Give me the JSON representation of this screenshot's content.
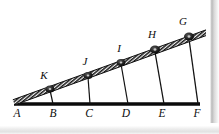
{
  "figure": {
    "type": "geometry-diagram",
    "background_color": "#ffffff",
    "ink_color": "#111111",
    "baseline": {
      "label": "ground-line",
      "x1": 14,
      "y1": 104,
      "x2": 200,
      "y2": 104,
      "thickness": 3.4
    },
    "incline": {
      "label": "hatched-rope-band",
      "x1": 14,
      "y1": 103,
      "x2": 207,
      "y2": 33,
      "band_thickness": 5.2,
      "hatch_spacing": 2.6,
      "description": "diagonal hatched band rising left to right"
    },
    "pulleys": [
      {
        "id": "K",
        "label": "K",
        "cx": 50,
        "cy": 89,
        "r": 3.4,
        "label_x": 44,
        "label_y": 79
      },
      {
        "id": "J",
        "label": "J",
        "cx": 88,
        "cy": 75,
        "r": 3.4,
        "label_x": 84,
        "label_y": 65
      },
      {
        "id": "I",
        "label": "I",
        "cx": 121,
        "cy": 62,
        "r": 3.4,
        "label_x": 118,
        "label_y": 52
      },
      {
        "id": "H",
        "label": "H",
        "cx": 155,
        "cy": 49,
        "r": 3.8,
        "label_x": 151,
        "label_y": 38
      },
      {
        "id": "G",
        "label": "G",
        "cx": 189,
        "cy": 36,
        "r": 3.8,
        "label_x": 181,
        "label_y": 25
      }
    ],
    "base_points": [
      {
        "id": "A",
        "label": "A",
        "x": 14,
        "y": 104,
        "label_x": 16,
        "label_y": 116
      },
      {
        "id": "B",
        "label": "B",
        "x": 52,
        "y": 104,
        "label_x": 52,
        "label_y": 116
      },
      {
        "id": "C",
        "label": "C",
        "x": 89,
        "y": 104,
        "label_x": 88,
        "label_y": 116
      },
      {
        "id": "D",
        "label": "D",
        "x": 127,
        "y": 104,
        "label_x": 125,
        "label_y": 116
      },
      {
        "id": "E",
        "label": "E",
        "x": 163,
        "y": 104,
        "label_x": 161,
        "label_y": 116
      },
      {
        "id": "F",
        "label": "F",
        "x": 199,
        "y": 104,
        "label_x": 196,
        "label_y": 116
      }
    ],
    "drop_lines": [
      {
        "id": "KB",
        "from": "K",
        "to": "B",
        "x1": 50,
        "y1": 90,
        "x2": 53,
        "y2": 104
      },
      {
        "id": "JC",
        "from": "J",
        "to": "C",
        "x1": 88,
        "y1": 77,
        "x2": 90,
        "y2": 104
      },
      {
        "id": "ID",
        "from": "I",
        "to": "D",
        "x1": 121,
        "y1": 64,
        "x2": 128,
        "y2": 104
      },
      {
        "id": "HE",
        "from": "H",
        "to": "E",
        "x1": 155,
        "y1": 52,
        "x2": 164,
        "y2": 104
      },
      {
        "id": "GF",
        "from": "G",
        "to": "F",
        "x1": 189,
        "y1": 39,
        "x2": 198,
        "y2": 104
      }
    ],
    "edges": {
      "right_strip_color": "#b9b9b9",
      "bottom_strip_color": "#e7e7e7"
    }
  }
}
